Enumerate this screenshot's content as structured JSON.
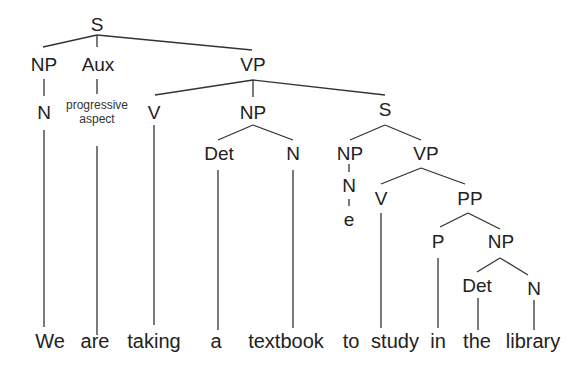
{
  "diagram": {
    "type": "syntax-tree",
    "colors": {
      "line": "#333333",
      "text": "#222222",
      "background": "#ffffff"
    },
    "nodes": {
      "s_root": "S",
      "np_subject": "NP",
      "aux": "Aux",
      "vp_main": "VP",
      "n_subject": "N",
      "aux_gloss_line1": "progressive",
      "aux_gloss_line2": "aspect",
      "v_main": "V",
      "np_object": "NP",
      "s_embedded": "S",
      "det_object": "Det",
      "n_object": "N",
      "np_embedded": "NP",
      "vp_embedded": "VP",
      "n_empty": "N",
      "empty_e": "e",
      "v_embedded": "V",
      "pp": "PP",
      "p": "P",
      "np_pp": "NP",
      "det_pp": "Det",
      "n_pp": "N"
    },
    "words": [
      "We",
      "are",
      "taking",
      "a",
      "textbook",
      "to",
      "study",
      "in",
      "the",
      "library"
    ]
  }
}
